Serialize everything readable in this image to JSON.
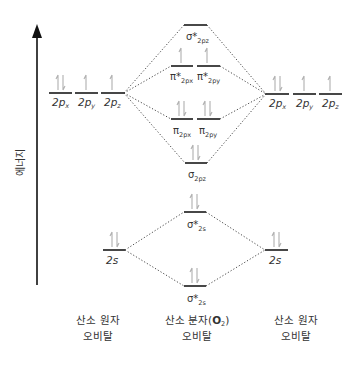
{
  "axis": {
    "label": "에너지"
  },
  "colors": {
    "level": "#1a1a1a",
    "electron": "#b0b0b0",
    "text": "#333333"
  },
  "left_atom": {
    "orbitals_2p": [
      {
        "label_main": "2p",
        "label_sub": "x",
        "electrons": "pair"
      },
      {
        "label_main": "2p",
        "label_sub": "y",
        "electrons": "up"
      },
      {
        "label_main": "2p",
        "label_sub": "z",
        "electrons": "up"
      }
    ],
    "orbital_2s": {
      "label": "2s",
      "electrons": "pair"
    },
    "caption_line1": "산소 원자",
    "caption_line2": "오비탈"
  },
  "right_atom": {
    "orbitals_2p": [
      {
        "label_main": "2p",
        "label_sub": "x",
        "electrons": "pair"
      },
      {
        "label_main": "2p",
        "label_sub": "y",
        "electrons": "up"
      },
      {
        "label_main": "2p",
        "label_sub": "z",
        "electrons": "up"
      }
    ],
    "orbital_2s": {
      "label": "2s",
      "electrons": "pair"
    },
    "caption_line1": "산소 원자",
    "caption_line2": "오비탈"
  },
  "molecule": {
    "sigma_star_2pz": {
      "label_main": "σ*",
      "label_sub": "2pz",
      "electrons": "none"
    },
    "pi_star_2px": {
      "label_main": "π*",
      "label_sub": "2px",
      "electrons": "up"
    },
    "pi_star_2py": {
      "label_main": "π*",
      "label_sub": "2py",
      "electrons": "up"
    },
    "pi_2px": {
      "label_main": "π",
      "label_sub": "2px",
      "electrons": "pair"
    },
    "pi_2py": {
      "label_main": "π",
      "label_sub": "2py",
      "electrons": "pair"
    },
    "sigma_2pz": {
      "label_main": "σ",
      "label_sub": "2pz",
      "electrons": "pair"
    },
    "sigma_star_2s": {
      "label_main": "σ*",
      "label_sub": "2s",
      "electrons": "pair"
    },
    "sigma_2s": {
      "label_main": "σ*",
      "label_sub": "2s",
      "electrons": "pair"
    },
    "caption_line1_prefix": "산소 분자(",
    "caption_formula_main": "O",
    "caption_formula_sub": "2",
    "caption_line1_suffix": ")",
    "caption_line2": "오비탈"
  }
}
